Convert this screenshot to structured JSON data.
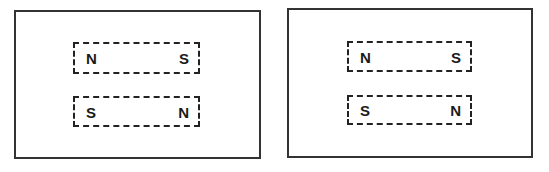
{
  "panels": [
    {
      "magnets": [
        {
          "left_pole": "N",
          "right_pole": "S"
        },
        {
          "left_pole": "S",
          "right_pole": "N"
        }
      ]
    },
    {
      "magnets": [
        {
          "left_pole": "N",
          "right_pole": "S"
        },
        {
          "left_pole": "S",
          "right_pole": "N"
        }
      ]
    }
  ],
  "colors": {
    "frame": "#333333",
    "dash": "#222222",
    "text": "#1a1a1a"
  }
}
